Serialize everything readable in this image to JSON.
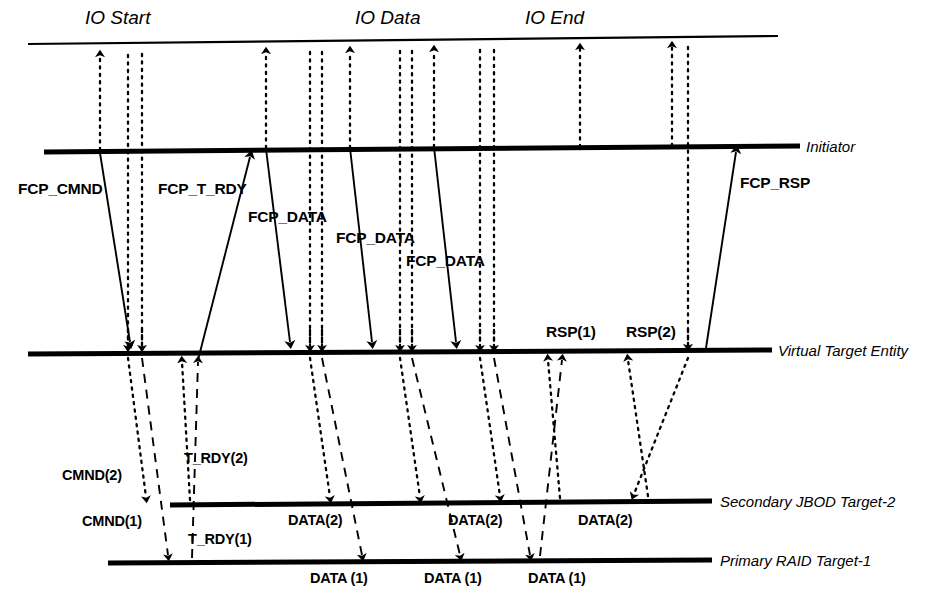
{
  "diagram": {
    "title_phases": [
      {
        "id": "io-start",
        "label": "IO Start",
        "x": 85,
        "y": 24
      },
      {
        "id": "io-data",
        "label": "IO Data",
        "x": 355,
        "y": 24
      },
      {
        "id": "io-end",
        "label": "IO End",
        "x": 525,
        "y": 24
      }
    ],
    "lifelines": [
      {
        "id": "timeline",
        "label": "",
        "y_left": 44,
        "y_right": 36,
        "x1": 28,
        "x2": 778,
        "weight": "thin"
      },
      {
        "id": "initiator",
        "label": "Initiator",
        "y_left": 152,
        "y_right": 146,
        "x1": 44,
        "x2": 800,
        "weight": "thick"
      },
      {
        "id": "virtual-target-entity",
        "label": "Virtual Target Entity",
        "y_left": 354,
        "y_right": 350,
        "x1": 28,
        "x2": 772,
        "weight": "thick"
      },
      {
        "id": "secondary-jbod-target-2",
        "label": "Secondary JBOD Target-2",
        "y_left": 505,
        "y_right": 501,
        "x1": 170,
        "x2": 712,
        "weight": "thick"
      },
      {
        "id": "primary-raid-target-1",
        "label": "Primary RAID Target-1",
        "y_left": 563,
        "y_right": 560,
        "x1": 108,
        "x2": 712,
        "weight": "thick"
      }
    ],
    "entity_label_x": 790,
    "messages": [
      {
        "id": "fcp-cmnd",
        "label": "FCP_CMND",
        "x": 18,
        "y": 194,
        "kind": "solid"
      },
      {
        "id": "fcp-t-rdy",
        "label": "FCP_T_RDY",
        "x": 158,
        "y": 194,
        "kind": "solid"
      },
      {
        "id": "fcp-data-1",
        "label": "FCP_DATA",
        "x": 248,
        "y": 222,
        "kind": "solid"
      },
      {
        "id": "fcp-data-2",
        "label": "FCP_DATA",
        "x": 336,
        "y": 243,
        "kind": "solid"
      },
      {
        "id": "fcp-data-3",
        "label": "FCP_DATA",
        "x": 406,
        "y": 266,
        "kind": "solid"
      },
      {
        "id": "fcp-rsp",
        "label": "FCP_RSP",
        "x": 740,
        "y": 188,
        "kind": "solid"
      },
      {
        "id": "rsp-1",
        "label": "RSP(1)",
        "x": 546,
        "y": 337,
        "kind": "solid"
      },
      {
        "id": "rsp-2",
        "label": "RSP(2)",
        "x": 626,
        "y": 337,
        "kind": "solid"
      },
      {
        "id": "cmnd-2",
        "label": "CMND(2)",
        "x": 62,
        "y": 480,
        "kind": "dotted"
      },
      {
        "id": "cmnd-1",
        "label": "CMND(1)",
        "x": 82,
        "y": 526,
        "kind": "dashed"
      },
      {
        "id": "t-rdy-2",
        "label": "T_RDY(2)",
        "x": 184,
        "y": 463,
        "kind": "dotted"
      },
      {
        "id": "t-rdy-1",
        "label": "T_RDY(1)",
        "x": 188,
        "y": 544,
        "kind": "dashed"
      },
      {
        "id": "data-2-a",
        "label": "DATA(2)",
        "x": 288,
        "y": 525,
        "kind": "dashed"
      },
      {
        "id": "data-2-b",
        "label": "DATA(2)",
        "x": 448,
        "y": 525,
        "kind": "dashed"
      },
      {
        "id": "data-2-c",
        "label": "DATA(2)",
        "x": 578,
        "y": 525,
        "kind": "dotted"
      },
      {
        "id": "data-1-a",
        "label": "DATA (1)",
        "x": 310,
        "y": 583,
        "kind": "dashed"
      },
      {
        "id": "data-1-b",
        "label": "DATA (1)",
        "x": 424,
        "y": 583,
        "kind": "dashed"
      },
      {
        "id": "data-1-c",
        "label": "DATA (1)",
        "x": 528,
        "y": 583,
        "kind": "dashed"
      }
    ],
    "event_ticks_top": [
      100,
      266,
      350,
      434,
      580,
      672
    ],
    "colors": {
      "ink": "#000000",
      "background": "#ffffff"
    }
  }
}
